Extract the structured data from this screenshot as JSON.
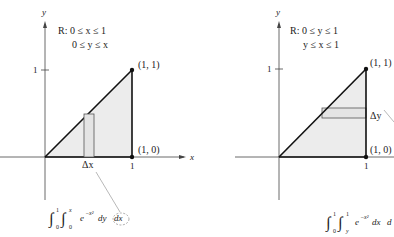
{
  "figure": {
    "left": {
      "axes": {
        "x_label": "x",
        "y_label": "y",
        "tick_x": "1",
        "tick_y": "1"
      },
      "region": {
        "line1": "R: 0 ≤ x ≤ 1",
        "line2": "0 ≤ y ≤ x"
      },
      "points": {
        "top": "(1, 1)",
        "bottom": "(1, 0)"
      },
      "delta_label": "Δx",
      "integral": {
        "outer_upper": "1",
        "outer_lower": "0",
        "inner_upper": "x",
        "inner_lower": "0",
        "integrand": "e",
        "exponent": "−x²",
        "inner_d": "dy",
        "outer_d": "dx"
      }
    },
    "right": {
      "axes": {
        "y_label": "y",
        "tick_x": "1",
        "tick_y": "1"
      },
      "region": {
        "line1": "R: 0 ≤ y ≤ 1",
        "line2": "y ≤ x ≤ 1"
      },
      "points": {
        "top": "(1, 1)",
        "bottom": "(1, 0)"
      },
      "delta_label": "Δy",
      "integral": {
        "outer_upper": "1",
        "outer_lower": "0",
        "inner_upper": "1",
        "inner_lower": "y",
        "integrand": "e",
        "exponent": "−x²",
        "inner_d": "dx",
        "outer_d": "d"
      }
    },
    "colors": {
      "fill": "#ececec",
      "line": "#222222",
      "leader": "#888888"
    }
  }
}
